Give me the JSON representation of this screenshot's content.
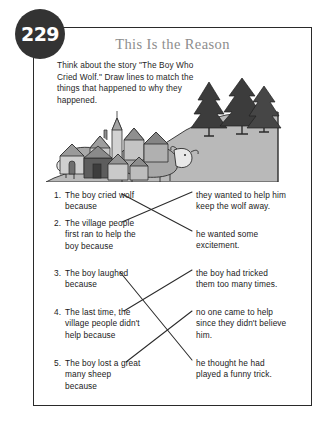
{
  "page": {
    "number": "229",
    "title": "This Is the Reason",
    "instructions": "Think about the story \"The Boy Who Cried Wolf.\" Draw lines to match the things that happened to why they happened."
  },
  "illustration": {
    "name": "village-hill-sheep-scene",
    "description": "A cluster of village houses at left on a slope, a gray hill at right with three dark pine trees on top and two sheep grazing on the hillside.",
    "colors": {
      "hill": "#b9b9b9",
      "tree": "#3c3c3c",
      "house_light": "#d2d2d2",
      "house_mid": "#9e9e9e",
      "house_dark": "#5d5d5d",
      "sheep_body": "#a8a8a8",
      "sheep_face": "#e8e8e8",
      "outline": "#2b2b2b"
    }
  },
  "exercise": {
    "prompts": [
      {
        "number": "1.",
        "text": "The boy cried wolf because"
      },
      {
        "number": "2.",
        "text": "The village people first ran to help the boy because"
      },
      {
        "number": "3.",
        "text": "The boy laughed because"
      },
      {
        "number": "4.",
        "text": "The last time, the village people didn't help because"
      },
      {
        "number": "5.",
        "text": "The boy lost a great many sheep because"
      }
    ],
    "answers": [
      {
        "text": "they wanted to help him keep the wolf away."
      },
      {
        "text": "he wanted some excitement."
      },
      {
        "text": "the boy had tricked them too many times."
      },
      {
        "text": "no one came to help since they didn't believe him."
      },
      {
        "text": "he thought he had played a funny trick."
      }
    ],
    "matches": [
      {
        "from_prompt": 1,
        "to_answer": 2
      },
      {
        "from_prompt": 2,
        "to_answer": 1
      },
      {
        "from_prompt": 3,
        "to_answer": 5
      },
      {
        "from_prompt": 4,
        "to_answer": 3
      },
      {
        "from_prompt": 5,
        "to_answer": 4
      }
    ]
  },
  "style": {
    "badge_bg": "#333333",
    "badge_text": "#ffffff",
    "title_color": "#8d8d8d",
    "border_color": "#2a2a2a",
    "line_color": "#2b2b2b",
    "body_text": "#1f1f1f"
  }
}
